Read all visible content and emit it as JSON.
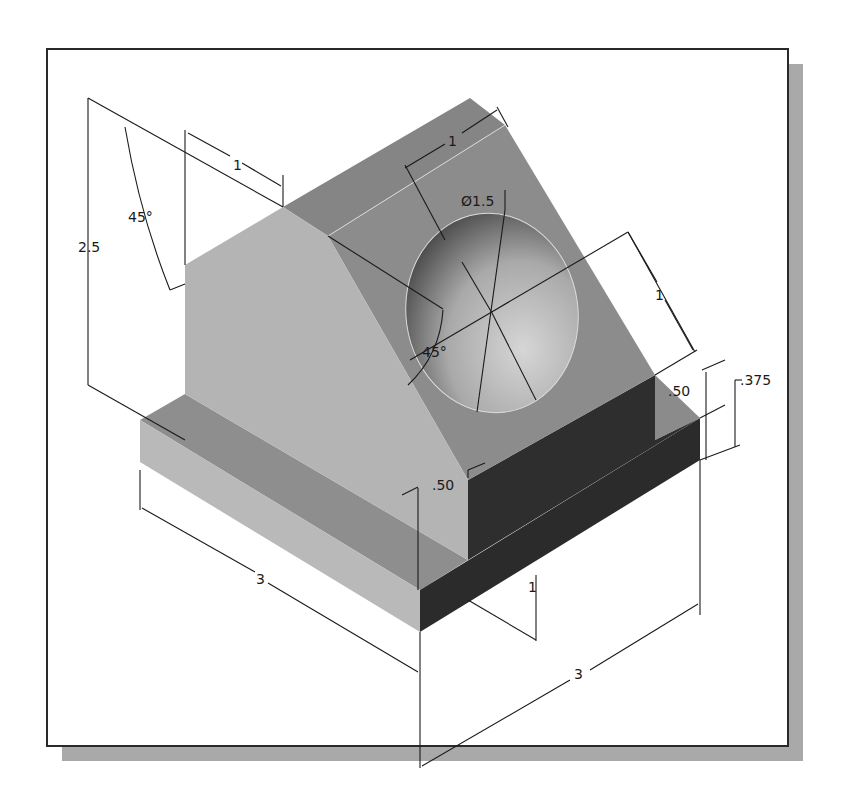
{
  "figure": {
    "type": "isometric-cad-drawing",
    "part_description": "Angled support block with through hole",
    "colors": {
      "frame_border": "#2a2a2a",
      "shadow": "#a9a9a9",
      "face_light": "#b4b4b4",
      "face_mid": "#8c8c8c",
      "face_top": "#858585",
      "face_dark": "#2b2b2b",
      "dim_line": "#1a1a1a"
    }
  },
  "dimensions": {
    "overall_height": "2.5",
    "slope_angle": "45°",
    "top_flat_width": "1",
    "slant_top_width": "1",
    "hole_diameter": "Ø1.5",
    "hole_center_offset": "1",
    "hole_angle": "45°",
    "base_thickness": ".375",
    "upright_thickness_right": ".50",
    "upright_thickness_front": ".50",
    "depth_left": "3",
    "width_right": "3",
    "step_height": "1"
  }
}
